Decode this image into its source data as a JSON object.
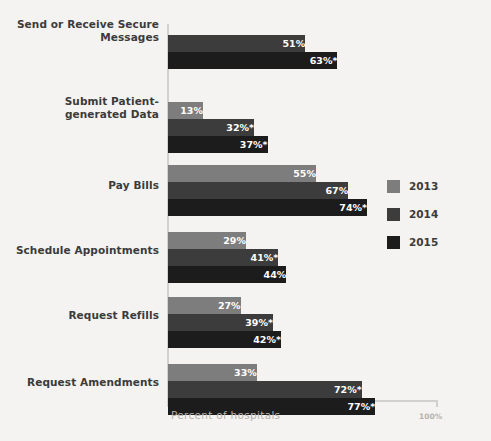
{
  "chart_data": {
    "type": "bar",
    "orientation": "horizontal",
    "title": "",
    "subtitle": "",
    "xlabel": "Percent of hospitals",
    "ylabel": "",
    "xlim": [
      0,
      100
    ],
    "xticks": [
      "100%"
    ],
    "grid": false,
    "legend_position": "right",
    "value_suffix": "%",
    "footnote_marker": "*",
    "categories": [
      "Send or Receive Secure Messages",
      "Submit Patient-generated Data",
      "Pay Bills",
      "Schedule Appointments",
      "Request Refills",
      "Request Amendments"
    ],
    "series": [
      {
        "name": "2013",
        "color": "#7d7d7d",
        "values": [
          null,
          13,
          55,
          29,
          27,
          33
        ],
        "labels": [
          "",
          "13%",
          "55%",
          "29%",
          "27%",
          "33%"
        ]
      },
      {
        "name": "2014",
        "color": "#3c3c3c",
        "values": [
          51,
          32,
          67,
          41,
          39,
          72
        ],
        "labels": [
          "51%",
          "32%*",
          "67%",
          "41%*",
          "39%*",
          "72%*"
        ]
      },
      {
        "name": "2015",
        "color": "#1c1c1c",
        "values": [
          63,
          37,
          74,
          44,
          42,
          77
        ],
        "labels": [
          "63%*",
          "37%*",
          "74%*",
          "44%",
          "42%*",
          "77%*"
        ]
      }
    ]
  },
  "axis": {
    "x_title": "Percent of hospitals",
    "x_max_label": "100%"
  },
  "legend": {
    "items": [
      {
        "label": "2013",
        "color": "#7d7d7d"
      },
      {
        "label": "2014",
        "color": "#3c3c3c"
      },
      {
        "label": "2015",
        "color": "#1c1c1c"
      }
    ]
  },
  "colors": {
    "background": "#f4f3f1",
    "axis": "#d2d0cc",
    "category_text": "#3b3b3b",
    "axis_text": "#b5b2ad",
    "value_text": "#ffffff"
  }
}
